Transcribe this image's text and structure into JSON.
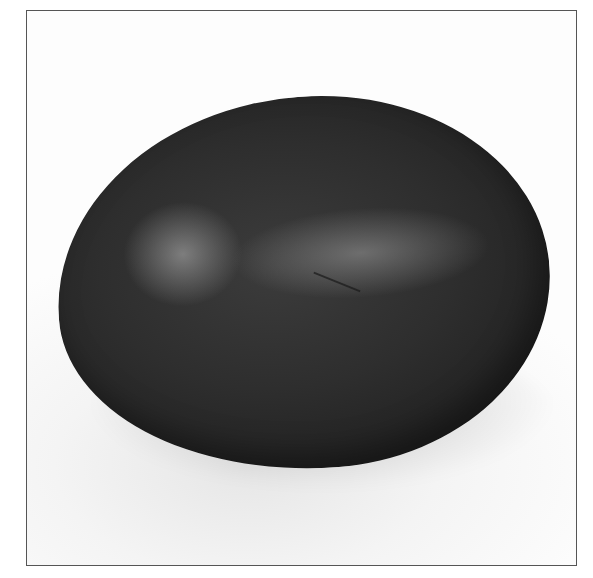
{
  "image": {
    "subject": "Dark egg photograph",
    "description": "Grayscale photograph of a single dark-shelled egg lying on a white surface, framed by a thin gray border",
    "colors": {
      "frame_border": "#555555",
      "background": "#fdfdfd",
      "egg_shell": "#2e2e2e",
      "highlight": "#969696"
    }
  }
}
